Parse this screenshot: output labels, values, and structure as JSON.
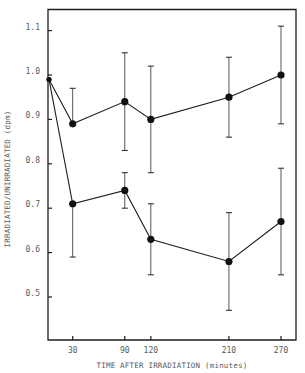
{
  "chart_data": {
    "type": "line",
    "title": "",
    "xlabel": "TIME AFTER IRRADIATION (minutes)",
    "ylabel": "IRRADIATED/UNIRRADIATED (dpm)",
    "x_ticks": [
      30,
      90,
      120,
      210,
      270
    ],
    "y_ticks": [
      0.5,
      0.6,
      0.7,
      0.8,
      0.9,
      1.0,
      1.1
    ],
    "y_tick_labels": [
      "0.5",
      "0.6",
      "0.7",
      "0.8",
      "0.9",
      "1.0",
      "1.1"
    ],
    "xlim": [
      -2,
      283
    ],
    "ylim": [
      0.4,
      1.15
    ],
    "grid": false,
    "legend": null,
    "error_bars": true,
    "x": [
      0,
      30,
      90,
      120,
      210,
      270
    ],
    "series": [
      {
        "name": "upper",
        "values": [
          0.99,
          0.89,
          0.94,
          0.9,
          0.95,
          1.0
        ],
        "err_high": [
          null,
          0.97,
          1.05,
          1.02,
          1.04,
          1.11
        ],
        "err_low": [
          null,
          null,
          0.83,
          0.78,
          0.86,
          0.89
        ]
      },
      {
        "name": "lower",
        "values": [
          0.99,
          0.71,
          0.74,
          0.63,
          0.58,
          0.67
        ],
        "err_high": [
          null,
          null,
          0.78,
          0.71,
          0.69,
          0.79
        ],
        "err_low": [
          null,
          0.59,
          0.7,
          0.55,
          0.47,
          0.55
        ]
      }
    ]
  }
}
